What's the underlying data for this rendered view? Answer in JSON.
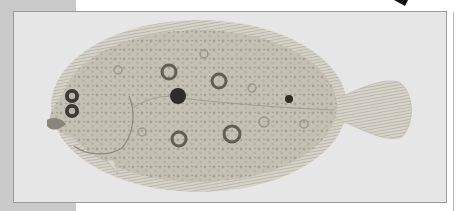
{
  "image": {
    "subject": "flatfish illustration",
    "description": "Scientific illustration of a flounder (left-eyed flatfish) with speckled tan-gray body, dark ocellated spots, and fan-shaped tail fin, printed on a gray-framed page",
    "colors": {
      "page_background": "#ffffff",
      "margin_band": "#c9c9c9",
      "frame_fill": "#e6e6e6",
      "frame_border": "#9a9a9a",
      "fish_body": "#c4c0b3",
      "fish_fins": "#d2cfc6",
      "spot_dark": "#3a3a3a",
      "ring_spot": "#6e6b63"
    }
  }
}
